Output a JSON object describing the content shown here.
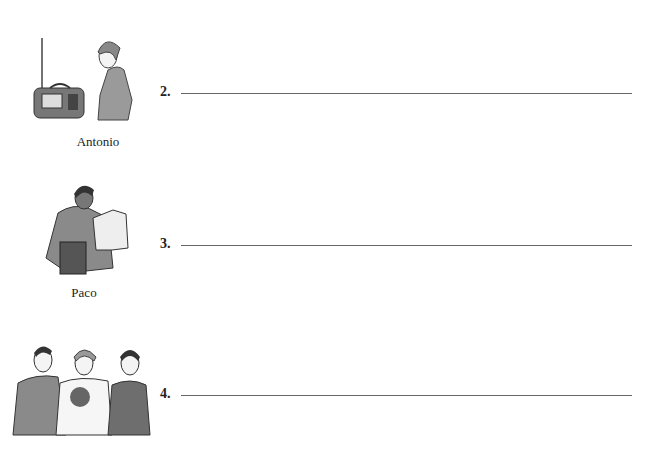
{
  "exercise": {
    "items": [
      {
        "number": "2.",
        "name": "Antonio",
        "illustration": "person-with-radio-icon",
        "answer": ""
      },
      {
        "number": "3.",
        "name": "Paco",
        "illustration": "person-reading-book-icon",
        "answer": ""
      },
      {
        "number": "4.",
        "name": "",
        "illustration": "three-people-with-flowers-icon",
        "answer": ""
      }
    ]
  },
  "colors": {
    "text": "#222222",
    "line": "#666666",
    "figure_shirt": "#8c8c8c"
  }
}
